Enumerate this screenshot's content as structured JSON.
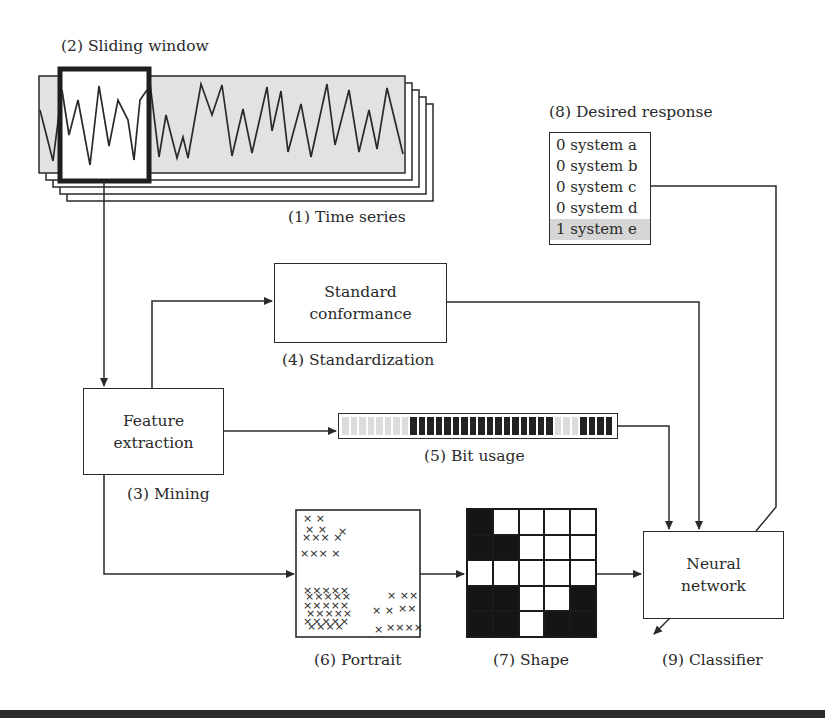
{
  "labels": {
    "sliding_window": "(2) Sliding window",
    "time_series": "(1) Time series",
    "desired_response": "(8) Desired response",
    "standardization": "(4) Standardization",
    "mining": "(3) Mining",
    "bit_usage": "(5) Bit usage",
    "portrait": "(6) Portrait",
    "shape": "(7) Shape",
    "classifier": "(9) Classifier"
  },
  "boxes": {
    "standard_conformance": [
      "Standard",
      "conformance"
    ],
    "feature_extraction": [
      "Feature",
      "extraction"
    ],
    "neural_network": [
      "Neural",
      "network"
    ]
  },
  "desired_response": {
    "rows": [
      {
        "value": "0",
        "system": "system a",
        "highlighted": false
      },
      {
        "value": "0",
        "system": "system b",
        "highlighted": false
      },
      {
        "value": "0",
        "system": "system c",
        "highlighted": false
      },
      {
        "value": "0",
        "system": "system d",
        "highlighted": false
      },
      {
        "value": "1",
        "system": "system e",
        "highlighted": true
      }
    ],
    "highlight_color": "#d6d6d6"
  },
  "bit_usage": {
    "bits": [
      0,
      0,
      0,
      0,
      0,
      0,
      0,
      0,
      1,
      1,
      1,
      1,
      1,
      1,
      1,
      1,
      1,
      1,
      1,
      1,
      1,
      1,
      1,
      1,
      1,
      0,
      0,
      0,
      1,
      1,
      1,
      1
    ],
    "on_color": "#222222",
    "off_color": "#dcdcdc"
  },
  "shape_grid": [
    [
      1,
      0,
      0,
      0,
      0
    ],
    [
      1,
      1,
      0,
      0,
      0
    ],
    [
      0,
      0,
      0,
      0,
      0
    ],
    [
      1,
      1,
      0,
      0,
      1
    ],
    [
      1,
      1,
      0,
      1,
      1
    ]
  ],
  "time_series": {
    "stack_count": 5,
    "fill_color": "#e2e2e2"
  }
}
